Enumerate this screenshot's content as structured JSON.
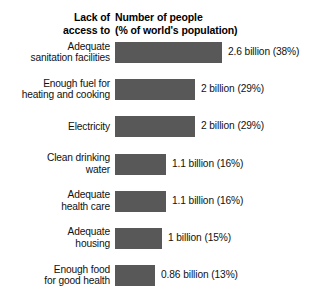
{
  "header": {
    "left_line1": "Lack of",
    "left_line2": "access to",
    "right_line1": "Number of people",
    "right_line2": "(% of world's population)"
  },
  "chart_data": {
    "type": "bar",
    "orientation": "horizontal",
    "xlabel": "Number of people (% of world's population)",
    "ylabel": "Lack of access to",
    "grid": false,
    "legend": "none",
    "axis_visible": false,
    "value_unit": "billion people",
    "xlim": [
      0,
      2.6
    ],
    "categories": [
      "Adequate sanitation facilities",
      "Enough fuel for heating and cooking",
      "Electricity",
      "Clean drinking water",
      "Adequate health care",
      "Adequate housing",
      "Enough food for good health"
    ],
    "values": [
      2.6,
      2,
      2,
      1.1,
      1.1,
      1,
      0.86
    ],
    "percents": [
      38,
      29,
      29,
      16,
      16,
      15,
      13
    ],
    "data_labels": [
      "2.6 billion (38%)",
      "2 billion (29%)",
      "2 billion (29%)",
      "1.1 billion (16%)",
      "1.1 billion (16%)",
      "1 billion (15%)",
      "0.86 billion (13%)"
    ],
    "bar_color": "#585858",
    "background_color": "#ffffff"
  },
  "rows": [
    {
      "label_line1": "Adequate",
      "label_line2": "sanitation facilities",
      "value_label": "2.6 billion (38%)",
      "bar_width_px": 107
    },
    {
      "label_line1": "Enough fuel for",
      "label_line2": "heating and cooking",
      "value_label": "2 billion (29%)",
      "bar_width_px": 80
    },
    {
      "label_line1": "Electricity",
      "label_line2": "",
      "value_label": "2 billion (29%)",
      "bar_width_px": 80
    },
    {
      "label_line1": "Clean drinking",
      "label_line2": "water",
      "value_label": "1.1 billion (16%)",
      "bar_width_px": 51
    },
    {
      "label_line1": "Adequate",
      "label_line2": "health care",
      "value_label": "1.1 billion (16%)",
      "bar_width_px": 51
    },
    {
      "label_line1": "Adequate",
      "label_line2": "housing",
      "value_label": "1 billion (15%)",
      "bar_width_px": 47
    },
    {
      "label_line1": "Enough food",
      "label_line2": "for good health",
      "value_label": "0.86 billion (13%)",
      "bar_width_px": 40
    }
  ]
}
